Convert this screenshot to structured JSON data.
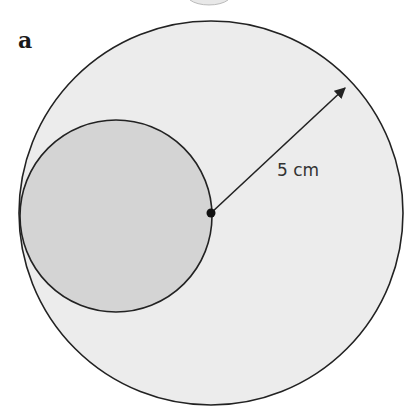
{
  "figure": {
    "part_label": "a",
    "radius_label": "5 cm",
    "colors": {
      "background": "#ffffff",
      "outer_fill": "#ececec",
      "inner_fill": "#d4d4d4",
      "stroke": "#222222"
    },
    "shapes": {
      "outer_circle": {
        "cx": 211,
        "cy": 213,
        "r": 192
      },
      "inner_circle": {
        "cx": 116,
        "cy": 216,
        "r": 96
      },
      "center_point": {
        "cx": 211,
        "cy": 213
      },
      "radius_arrow": {
        "x1": 211,
        "y1": 213,
        "x2": 347,
        "y2": 86
      }
    }
  }
}
